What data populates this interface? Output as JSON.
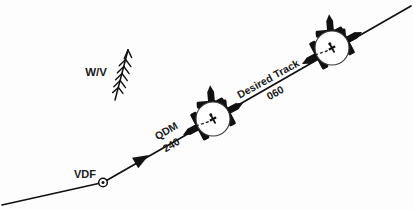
{
  "diagram": {
    "background_color": "#fdfdfd",
    "ink_color": "#111111",
    "labels": {
      "wind_velocity": "W/V",
      "station": "VDF",
      "qdm_name": "QDM",
      "qdm_value": "240",
      "track_name": "Desired Track",
      "track_value": "060"
    },
    "elements": {
      "track_line": {
        "name": "desired-track-line",
        "from": [
          2,
          205
        ],
        "to": [
          411,
          6
        ],
        "bend_at": [
          103,
          182
        ],
        "stroke_width": 1.6
      },
      "direction_arrow": {
        "name": "qdm-arrow",
        "at": [
          146,
          156
        ],
        "points_toward": "VDF station (down-left)",
        "heading_deg": 240
      },
      "vdf_station": {
        "name": "vdf-station-symbol",
        "at": [
          103,
          182
        ],
        "outer_radius": 4.2,
        "inner_radius": 1.6
      },
      "wind_arrow": {
        "name": "wind-velocity-arrow",
        "shaft_top": [
          127,
          52
        ],
        "shaft_bottom": [
          116,
          98
        ],
        "barb_count": 5
      },
      "aircraft_group_1": {
        "name": "aircraft-group-lower",
        "center": [
          213,
          119
        ],
        "circle_radius": 17,
        "aircraft_headings_deg": [
          24,
          150,
          292
        ]
      },
      "aircraft_group_2": {
        "name": "aircraft-group-upper",
        "center": [
          332,
          48
        ],
        "circle_radius": 17,
        "aircraft_headings_deg": [
          24,
          150,
          292
        ]
      }
    },
    "label_positions": {
      "wind_velocity": [
        101,
        72
      ],
      "station": [
        86,
        177
      ],
      "qdm_name": [
        168,
        133
      ],
      "qdm_value": [
        172,
        147
      ],
      "track_name": [
        268,
        82
      ],
      "track_value": [
        276,
        96
      ]
    }
  }
}
